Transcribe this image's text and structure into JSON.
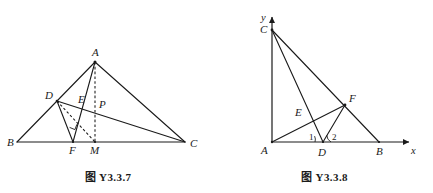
{
  "page": {
    "kind": "geometry-figure-pair",
    "background_color": "#ffffff",
    "stroke_color": "#1a1a1a"
  },
  "figures": [
    {
      "id": "fig-y337",
      "caption": "图 Y3.3.7",
      "description": "Triangle ABC with cevians; D on AB, F and M on BC, E and P interior points",
      "points": [
        {
          "name": "A",
          "label": "A",
          "x": 95,
          "y": 62,
          "label_dx": -3,
          "label_dy": -6
        },
        {
          "name": "B",
          "label": "B",
          "x": 17,
          "y": 142,
          "label_dx": -10,
          "label_dy": 4
        },
        {
          "name": "C",
          "label": "C",
          "x": 185,
          "y": 142,
          "label_dx": 5,
          "label_dy": 5
        },
        {
          "name": "D",
          "label": "D",
          "x": 57,
          "y": 101,
          "label_dx": -10,
          "label_dy": -2
        },
        {
          "name": "E",
          "label": "E",
          "x": 82,
          "y": 106,
          "label_dx": -1,
          "label_dy": -3
        },
        {
          "name": "P",
          "label": "P",
          "x": 95,
          "y": 107,
          "label_dx": 3,
          "label_dy": 1
        },
        {
          "name": "F",
          "label": "F",
          "x": 73,
          "y": 142,
          "label_dx": -3,
          "label_dy": 12
        },
        {
          "name": "M",
          "label": "M",
          "x": 95,
          "y": 142,
          "label_dx": -4,
          "label_dy": 12
        }
      ],
      "segments": [
        {
          "name": "side-BC",
          "from": "B",
          "to": "C",
          "style": "solid"
        },
        {
          "name": "side-AB",
          "from": "A",
          "to": "B",
          "style": "solid"
        },
        {
          "name": "side-AC",
          "from": "A",
          "to": "C",
          "style": "solid"
        },
        {
          "name": "segment-DC",
          "from": "D",
          "to": "C",
          "style": "solid"
        },
        {
          "name": "segment-AF",
          "from": "A",
          "to": "F",
          "style": "solid"
        },
        {
          "name": "segment-DF",
          "from": "D",
          "to": "F",
          "style": "solid"
        },
        {
          "name": "segment-AM",
          "from": "A",
          "to": "M",
          "style": "dashed"
        },
        {
          "name": "segment-DM",
          "from": "D",
          "to": "M",
          "style": "dashed"
        }
      ],
      "marks": [
        {
          "name": "right-angle-mark-at-F",
          "vertex": "F",
          "type": "right-angle"
        }
      ]
    },
    {
      "id": "fig-y338",
      "caption": "图 Y3.3.8",
      "description": "Right triangle on coordinate axes: A at origin, C on y-axis, B on x-axis, D on AB, F on CB, angles 1 and 2 at D",
      "axes": {
        "x_label": "x",
        "y_label": "y",
        "origin": {
          "x": 272,
          "y": 142
        },
        "x_end": {
          "x": 412,
          "y": 142
        },
        "y_end": {
          "x": 272,
          "y": 14
        },
        "x_label_pos": {
          "x": 412,
          "y": 153
        },
        "y_label_pos": {
          "x": 262,
          "y": 20
        }
      },
      "points": [
        {
          "name": "A",
          "label": "A",
          "x": 272,
          "y": 142,
          "label_dx": -10,
          "label_dy": 11
        },
        {
          "name": "B",
          "label": "B",
          "x": 379,
          "y": 142,
          "label_dx": -2,
          "label_dy": 12
        },
        {
          "name": "C",
          "label": "C",
          "x": 272,
          "y": 30,
          "label_dx": -11,
          "label_dy": 2
        },
        {
          "name": "D",
          "label": "D",
          "x": 323,
          "y": 142,
          "label_dx": -4,
          "label_dy": 13
        },
        {
          "name": "E",
          "label": "E",
          "x": 306,
          "y": 117,
          "label_dx": -10,
          "label_dy": -2
        },
        {
          "name": "F",
          "label": "F",
          "x": 345,
          "y": 105,
          "label_dx": 4,
          "label_dy": -4
        }
      ],
      "segments": [
        {
          "name": "segment-CB",
          "from": "C",
          "to": "B",
          "style": "solid"
        },
        {
          "name": "segment-CD",
          "from": "C",
          "to": "D",
          "style": "solid"
        },
        {
          "name": "segment-AF",
          "from": "A",
          "to": "F",
          "style": "solid"
        },
        {
          "name": "segment-DF",
          "from": "D",
          "to": "F",
          "style": "solid"
        },
        {
          "name": "segment-AC",
          "from": "A",
          "to": "C",
          "style": "solid"
        }
      ],
      "angle_labels": [
        {
          "name": "angle-1",
          "label": "1",
          "x": 312,
          "y": 137
        },
        {
          "name": "angle-2",
          "label": "2",
          "x": 331,
          "y": 137
        }
      ],
      "angle_arcs": [
        {
          "name": "angle-arc-1",
          "vertex": "D",
          "radius": 8,
          "from_deg": 180,
          "to_deg": 123
        },
        {
          "name": "angle-arc-2",
          "vertex": "D",
          "radius": 8,
          "from_deg": 62,
          "to_deg": 0
        }
      ]
    }
  ]
}
